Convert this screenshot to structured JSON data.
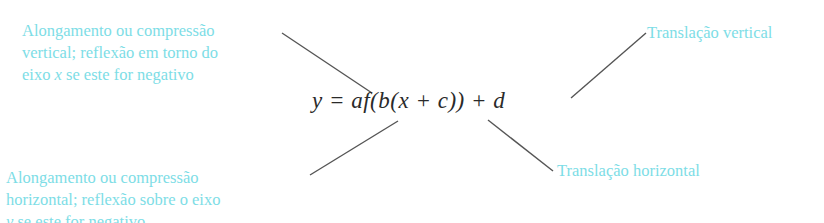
{
  "formula": {
    "text": "y = af(b(x + c)) + d"
  },
  "annotations": {
    "top_left": {
      "line1": "Alongamento ou compressão",
      "line2": "vertical; reflexão em torno do",
      "line3_pre": "eixo ",
      "line3_var": "x",
      "line3_post": " se este for negativo"
    },
    "top_right": {
      "line1": "Translação vertical"
    },
    "bottom_left": {
      "line1": "Alongamento ou compressão",
      "line2": "horizontal; reflexão sobre o eixo",
      "line3_var": "y",
      "line3_post": " se este for negativo"
    },
    "bottom_right": {
      "line1": "Translação horizontal"
    }
  },
  "colors": {
    "label": "#7ddde6",
    "formula": "#2a2a2a",
    "leader_line": "#555555"
  }
}
